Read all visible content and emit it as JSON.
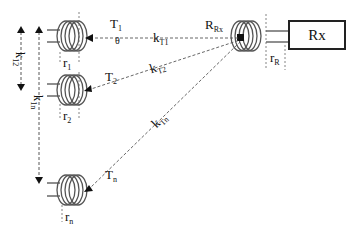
{
  "diagram": {
    "transmitters": [
      {
        "label": "T",
        "sub": "1",
        "radius_label": "r",
        "radius_sub": "1"
      },
      {
        "label": "T",
        "sub": "2",
        "radius_label": "r",
        "radius_sub": "2"
      },
      {
        "label": "T",
        "sub": "n",
        "radius_label": "r",
        "radius_sub": "n"
      }
    ],
    "receiver": {
      "coil_label": "R",
      "coil_sub": "Rx",
      "box_label": "Rx",
      "radius_label": "r",
      "radius_sub": "R"
    },
    "couplings": [
      {
        "label": "k",
        "sub": "T1"
      },
      {
        "label": "k",
        "sub": "T2"
      },
      {
        "label": "k",
        "sub": "Tn"
      }
    ],
    "tx_couplings": [
      {
        "label": "k",
        "sub": "12"
      },
      {
        "label": "k",
        "sub": "1n"
      }
    ],
    "angle_label": "θ",
    "colors": {
      "line": "#333333",
      "coil": "#555555"
    }
  }
}
